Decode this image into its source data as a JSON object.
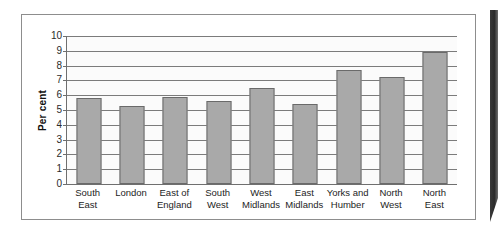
{
  "chart_data": {
    "type": "bar",
    "title": "",
    "subtitle": "",
    "xlabel": "",
    "ylabel": "Per cent",
    "ylim": [
      0,
      10
    ],
    "ytick_step": 1,
    "yticks": [
      "0",
      "1",
      "2",
      "3",
      "4",
      "5",
      "6",
      "7",
      "8",
      "9",
      "10"
    ],
    "grid": true,
    "legend": false,
    "categories": [
      "South East",
      "London",
      "East of England",
      "South West",
      "West Midlands",
      "East Midlands",
      "Yorks and Humber",
      "North West",
      "North East"
    ],
    "category_lines": [
      [
        "South",
        "East"
      ],
      [
        "London",
        ""
      ],
      [
        "East of",
        "England"
      ],
      [
        "South",
        "West"
      ],
      [
        "West",
        "Midlands"
      ],
      [
        "East",
        "Midlands"
      ],
      [
        "Yorks and",
        "Humber"
      ],
      [
        "North",
        "West"
      ],
      [
        "North",
        "East"
      ]
    ],
    "values": [
      5.8,
      5.3,
      5.9,
      5.6,
      6.5,
      5.4,
      7.7,
      7.2,
      8.9
    ],
    "bar_color": "#a9a9a9",
    "bar_edge_color": "#6a6a6a",
    "gridline_color": "#7b7b7b",
    "axis_color": "#6f6f6f",
    "plot_background": "#fbfbfb",
    "figure_background": "#ffffff",
    "frame_border_color": "#8d8d8d"
  }
}
